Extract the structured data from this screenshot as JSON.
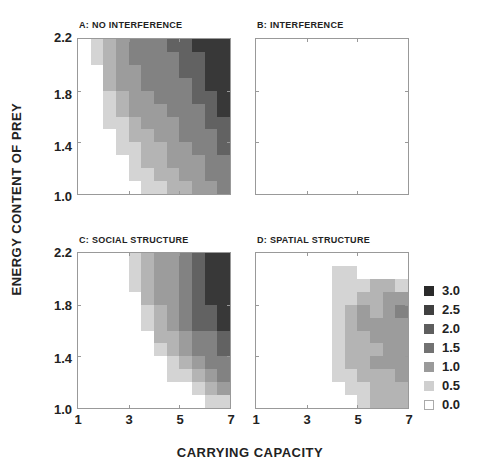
{
  "chart_data": {
    "type": "heatmap",
    "xlabel": "CARRYING CAPACITY",
    "ylabel": "ENERGY CONTENT OF PREY",
    "x_ticks": [
      "1",
      "3",
      "5",
      "7"
    ],
    "y_ticks": [
      "2.2",
      "1.8",
      "1.4",
      "1.0"
    ],
    "xlim": [
      1,
      7
    ],
    "ylim": [
      1.0,
      2.2
    ],
    "grid_size": [
      12,
      12
    ],
    "legend": {
      "position": "right",
      "entries": [
        {
          "label": "3.0",
          "color": "#2a2a2a"
        },
        {
          "label": "2.5",
          "color": "#404040"
        },
        {
          "label": "2.0",
          "color": "#5e5e5e"
        },
        {
          "label": "1.5",
          "color": "#727272"
        },
        {
          "label": "1.0",
          "color": "#9a9a9a"
        },
        {
          "label": "0.5",
          "color": "#cfcfcf"
        },
        {
          "label": "0.0",
          "color": "#ffffff"
        }
      ]
    },
    "level_colors": [
      "#ffffff",
      "#d4d4d4",
      "#b4b4b4",
      "#9c9c9c",
      "#828282",
      "#626262",
      "#383838"
    ],
    "panels": [
      {
        "id": "A",
        "title": "A: NO INTERFERENCE",
        "rows": [
          [
            0,
            1,
            2,
            3,
            4,
            4,
            4,
            5,
            5,
            6,
            6,
            6
          ],
          [
            0,
            1,
            2,
            3,
            4,
            4,
            4,
            4,
            5,
            5,
            6,
            6
          ],
          [
            0,
            0,
            2,
            3,
            3,
            4,
            4,
            4,
            5,
            5,
            6,
            6
          ],
          [
            0,
            0,
            2,
            3,
            3,
            4,
            4,
            4,
            4,
            5,
            6,
            6
          ],
          [
            0,
            0,
            1,
            2,
            3,
            3,
            4,
            4,
            4,
            5,
            5,
            6
          ],
          [
            0,
            0,
            1,
            2,
            3,
            3,
            3,
            4,
            4,
            4,
            5,
            6
          ],
          [
            0,
            0,
            1,
            1,
            2,
            3,
            3,
            3,
            4,
            4,
            5,
            5
          ],
          [
            0,
            0,
            0,
            1,
            2,
            2,
            3,
            3,
            4,
            4,
            4,
            5
          ],
          [
            0,
            0,
            0,
            1,
            1,
            2,
            2,
            3,
            3,
            4,
            4,
            5
          ],
          [
            0,
            0,
            0,
            0,
            1,
            2,
            2,
            3,
            3,
            3,
            4,
            4
          ],
          [
            0,
            0,
            0,
            0,
            1,
            1,
            2,
            2,
            3,
            3,
            4,
            4
          ],
          [
            0,
            0,
            0,
            0,
            0,
            1,
            1,
            2,
            2,
            3,
            3,
            4
          ]
        ]
      },
      {
        "id": "B",
        "title": "B: INTERFERENCE",
        "rows": [
          [
            0,
            0,
            0,
            0,
            0,
            0,
            0,
            0,
            0,
            0,
            0,
            0
          ],
          [
            0,
            0,
            0,
            0,
            0,
            0,
            0,
            0,
            0,
            0,
            0,
            0
          ],
          [
            0,
            0,
            0,
            0,
            0,
            0,
            0,
            0,
            0,
            0,
            0,
            0
          ],
          [
            0,
            0,
            0,
            0,
            0,
            0,
            0,
            0,
            0,
            0,
            0,
            0
          ],
          [
            0,
            0,
            0,
            0,
            0,
            0,
            0,
            0,
            0,
            0,
            0,
            0
          ],
          [
            0,
            0,
            0,
            0,
            0,
            0,
            0,
            0,
            0,
            0,
            0,
            0
          ],
          [
            0,
            0,
            0,
            0,
            0,
            0,
            0,
            0,
            0,
            0,
            0,
            0
          ],
          [
            0,
            0,
            0,
            0,
            0,
            0,
            0,
            0,
            0,
            0,
            0,
            0
          ],
          [
            0,
            0,
            0,
            0,
            0,
            0,
            0,
            0,
            0,
            0,
            0,
            0
          ],
          [
            0,
            0,
            0,
            0,
            0,
            0,
            0,
            0,
            0,
            0,
            0,
            0
          ],
          [
            0,
            0,
            0,
            0,
            0,
            0,
            0,
            0,
            0,
            0,
            0,
            0
          ],
          [
            0,
            0,
            0,
            0,
            0,
            0,
            0,
            0,
            0,
            0,
            0,
            0
          ]
        ]
      },
      {
        "id": "C",
        "title": "C: SOCIAL STRUCTURE",
        "rows": [
          [
            0,
            0,
            0,
            0,
            1,
            2,
            3,
            3,
            4,
            5,
            6,
            6
          ],
          [
            0,
            0,
            0,
            0,
            1,
            2,
            3,
            3,
            4,
            5,
            6,
            6
          ],
          [
            0,
            0,
            0,
            0,
            1,
            2,
            3,
            3,
            4,
            5,
            6,
            6
          ],
          [
            0,
            0,
            0,
            0,
            0,
            2,
            3,
            3,
            4,
            5,
            6,
            6
          ],
          [
            0,
            0,
            0,
            0,
            0,
            1,
            2,
            3,
            4,
            5,
            5,
            6
          ],
          [
            0,
            0,
            0,
            0,
            0,
            1,
            2,
            3,
            4,
            5,
            5,
            6
          ],
          [
            0,
            0,
            0,
            0,
            0,
            0,
            2,
            2,
            3,
            4,
            4,
            5
          ],
          [
            0,
            0,
            0,
            0,
            0,
            0,
            1,
            2,
            3,
            4,
            4,
            5
          ],
          [
            0,
            0,
            0,
            0,
            0,
            0,
            0,
            1,
            2,
            3,
            4,
            4
          ],
          [
            0,
            0,
            0,
            0,
            0,
            0,
            0,
            1,
            1,
            2,
            3,
            4
          ],
          [
            0,
            0,
            0,
            0,
            0,
            0,
            0,
            0,
            0,
            1,
            2,
            3
          ],
          [
            0,
            0,
            0,
            0,
            0,
            0,
            0,
            0,
            0,
            0,
            1,
            1
          ]
        ]
      },
      {
        "id": "D",
        "title": "D: SPATIAL STRUCTURE",
        "rows": [
          [
            0,
            0,
            0,
            0,
            0,
            0,
            0,
            0,
            0,
            0,
            0,
            0
          ],
          [
            0,
            0,
            0,
            0,
            0,
            0,
            1,
            1,
            0,
            0,
            0,
            0
          ],
          [
            0,
            0,
            0,
            0,
            0,
            0,
            1,
            1,
            1,
            2,
            2,
            1
          ],
          [
            0,
            0,
            0,
            0,
            0,
            0,
            1,
            1,
            2,
            2,
            3,
            3
          ],
          [
            0,
            0,
            0,
            0,
            0,
            0,
            1,
            2,
            3,
            2,
            3,
            4
          ],
          [
            0,
            0,
            0,
            0,
            0,
            0,
            1,
            2,
            3,
            3,
            3,
            3
          ],
          [
            0,
            0,
            0,
            0,
            0,
            0,
            1,
            2,
            2,
            3,
            3,
            3
          ],
          [
            0,
            0,
            0,
            0,
            0,
            0,
            1,
            2,
            2,
            2,
            3,
            3
          ],
          [
            0,
            0,
            0,
            0,
            0,
            0,
            1,
            2,
            2,
            3,
            3,
            3
          ],
          [
            0,
            0,
            0,
            0,
            0,
            0,
            1,
            1,
            2,
            2,
            2,
            3
          ],
          [
            0,
            0,
            0,
            0,
            0,
            0,
            0,
            1,
            1,
            2,
            2,
            2
          ],
          [
            0,
            0,
            0,
            0,
            0,
            0,
            0,
            0,
            1,
            2,
            2,
            2
          ]
        ]
      }
    ]
  }
}
